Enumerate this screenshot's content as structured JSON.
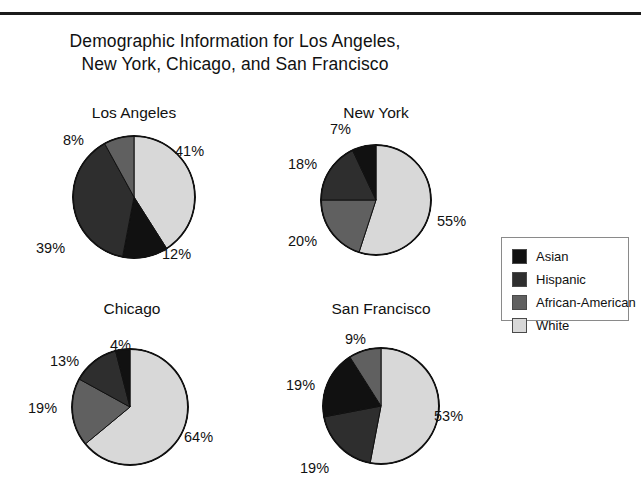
{
  "figure": {
    "title": "Demographic Information for Los Angeles,\nNew York, Chicago, and San Francisco"
  },
  "legend": {
    "items": [
      {
        "label": "Asian",
        "color": "#111111"
      },
      {
        "label": "Hispanic",
        "color": "#2e2e2e"
      },
      {
        "label": "African-American",
        "color": "#606060"
      },
      {
        "label": "White",
        "color": "#d8d8d8"
      }
    ]
  },
  "chart_data": {
    "type": "pie",
    "title": "Demographic Information for Los Angeles, New York, Chicago, and San Francisco",
    "legend_position": "right",
    "units": "percent",
    "categories": [
      "Asian",
      "Hispanic",
      "African-American",
      "White"
    ],
    "colors": {
      "Asian": "#111111",
      "Hispanic": "#2e2e2e",
      "African-American": "#606060",
      "White": "#d8d8d8"
    },
    "charts": [
      {
        "title": "Los Angeles",
        "slices": [
          {
            "label": "White",
            "value": 41,
            "text": "41%"
          },
          {
            "label": "Asian",
            "value": 12,
            "text": "12%"
          },
          {
            "label": "Hispanic",
            "value": 39,
            "text": "39%"
          },
          {
            "label": "African-American",
            "value": 8,
            "text": "8%"
          }
        ]
      },
      {
        "title": "New York",
        "slices": [
          {
            "label": "White",
            "value": 55,
            "text": "55%"
          },
          {
            "label": "African-American",
            "value": 20,
            "text": "20%"
          },
          {
            "label": "Hispanic",
            "value": 18,
            "text": "18%"
          },
          {
            "label": "Asian",
            "value": 7,
            "text": "7%"
          }
        ]
      },
      {
        "title": "Chicago",
        "slices": [
          {
            "label": "White",
            "value": 64,
            "text": "64%"
          },
          {
            "label": "African-American",
            "value": 19,
            "text": "19%"
          },
          {
            "label": "Hispanic",
            "value": 13,
            "text": "13%"
          },
          {
            "label": "Asian",
            "value": 4,
            "text": "4%"
          }
        ]
      },
      {
        "title": "San Francisco",
        "slices": [
          {
            "label": "White",
            "value": 53,
            "text": "53%"
          },
          {
            "label": "Hispanic",
            "value": 19,
            "text": "19%"
          },
          {
            "label": "Asian",
            "value": 19,
            "text": "19%"
          },
          {
            "label": "African-American",
            "value": 9,
            "text": "9%"
          }
        ]
      }
    ]
  },
  "panels": {
    "los_angeles": {
      "title": "Los Angeles",
      "pct": {
        "white": "41%",
        "asian": "12%",
        "hispanic": "39%",
        "african_american": "8%"
      }
    },
    "new_york": {
      "title": "New York",
      "pct": {
        "white": "55%",
        "african_american": "20%",
        "hispanic": "18%",
        "asian": "7%"
      }
    },
    "chicago": {
      "title": "Chicago",
      "pct": {
        "white": "64%",
        "african_american": "19%",
        "hispanic": "13%",
        "asian": "4%"
      }
    },
    "san_francisco": {
      "title": "San Francisco",
      "pct": {
        "white": "53%",
        "hispanic": "19%",
        "asian": "19%",
        "african_american": "9%"
      }
    }
  }
}
